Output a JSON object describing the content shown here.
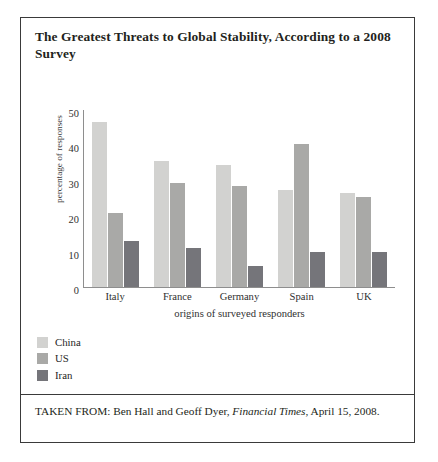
{
  "figure": {
    "title": "The Greatest Threats to Global Stability, According to a 2008 Survey",
    "source_prefix": "TAKEN FROM: Ben Hall and Geoff Dyer,",
    "source_publication": "Financial Times",
    "source_suffix": ", April 15, 2008."
  },
  "legend": {
    "items": [
      {
        "label": "China",
        "color": "#d2d2d0"
      },
      {
        "label": "US",
        "color": "#a9a9a7"
      },
      {
        "label": "Iran",
        "color": "#75757a"
      }
    ]
  },
  "chart_data": {
    "type": "bar",
    "title": "The Greatest Threats to Global Stability, According to a 2008 Survey",
    "xlabel": "origins of surveyed responders",
    "ylabel": "percentage of responses",
    "categories": [
      "Italy",
      "France",
      "Germany",
      "Spain",
      "UK"
    ],
    "series": [
      {
        "name": "China",
        "color": "#d2d2d0",
        "values": [
          46.5,
          35.5,
          34.5,
          27.5,
          26.5
        ]
      },
      {
        "name": "US",
        "color": "#a9a9a7",
        "values": [
          21.0,
          29.5,
          28.5,
          40.5,
          25.5
        ]
      },
      {
        "name": "Iran",
        "color": "#75757a",
        "values": [
          13.0,
          11.0,
          6.0,
          10.0,
          10.0
        ]
      }
    ],
    "ylim": [
      0,
      50
    ],
    "yticks": [
      0,
      10,
      20,
      30,
      40,
      50
    ],
    "grid": false,
    "legend_position": "below-plot-left"
  }
}
